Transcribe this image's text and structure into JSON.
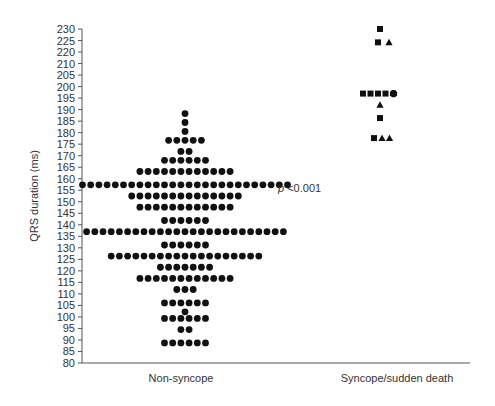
{
  "chart_data": {
    "type": "scatter",
    "subtype": "dot-plot",
    "title": "",
    "xlabel": "",
    "ylabel": "QRS duration (ms)",
    "ylim": [
      80,
      230
    ],
    "y_tick_labels": [
      "230",
      "225",
      "220",
      "210",
      "205",
      "200",
      "195",
      "190",
      "185",
      "180",
      "175",
      "170",
      "165",
      "160",
      "155",
      "150",
      "145",
      "140",
      "135",
      "130",
      "125",
      "120",
      "115",
      "110",
      "105",
      "100",
      "95",
      "90",
      "85",
      "80"
    ],
    "grid": false,
    "legend": null,
    "categories": [
      "Non-syncope",
      "Syncope/sudden death"
    ],
    "annotation": {
      "text_italic": "p",
      "text": " <0.001"
    },
    "series": [
      {
        "name": "Non-syncope",
        "marker": "circle",
        "rows": [
          {
            "y": 192,
            "count": 1
          },
          {
            "y": 188,
            "count": 1
          },
          {
            "y": 184,
            "count": 1
          },
          {
            "y": 180,
            "count": 5
          },
          {
            "y": 175,
            "count": 2
          },
          {
            "y": 171,
            "count": 6
          },
          {
            "y": 166,
            "count": 12
          },
          {
            "y": 160,
            "count": 26
          },
          {
            "y": 155,
            "count": 14
          },
          {
            "y": 150,
            "count": 12
          },
          {
            "y": 144,
            "count": 6
          },
          {
            "y": 139,
            "count": 25
          },
          {
            "y": 133,
            "count": 6
          },
          {
            "y": 128,
            "count": 19
          },
          {
            "y": 123,
            "count": 7
          },
          {
            "y": 118,
            "count": 12
          },
          {
            "y": 113,
            "count": 3
          },
          {
            "y": 107,
            "count": 6
          },
          {
            "y": 103,
            "count": 1
          },
          {
            "y": 100,
            "count": 6
          },
          {
            "y": 95,
            "count": 2
          },
          {
            "y": 89,
            "count": 6
          }
        ]
      },
      {
        "name": "Syncope/sudden death",
        "points": [
          {
            "y": 230,
            "markers": [
              "square"
            ]
          },
          {
            "y": 224,
            "markers": [
              "square",
              "triangle"
            ]
          },
          {
            "y": 201,
            "markers": [
              "square",
              "square",
              "square",
              "square",
              "circle"
            ]
          },
          {
            "y": 196,
            "markers": [
              "triangle"
            ]
          },
          {
            "y": 190,
            "markers": [
              "square"
            ]
          },
          {
            "y": 181,
            "markers": [
              "square",
              "triangle",
              "triangle"
            ]
          }
        ]
      }
    ]
  },
  "colors": {
    "marker": "#111111",
    "axis": "#555555",
    "text": "#333333"
  }
}
